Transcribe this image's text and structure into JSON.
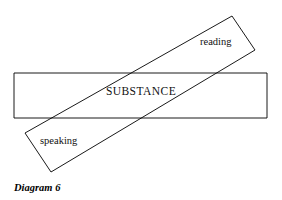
{
  "figure": {
    "caption": "Diagram 6",
    "background_color": "#ffffff",
    "stroke_color": "#000000",
    "text_color": "#000000",
    "width": 282,
    "height": 200
  },
  "shapes": {
    "horizontal_band": {
      "name": "SUBSTANCE",
      "label": "SUBSTANCE",
      "x": 14,
      "y": 73,
      "width": 253,
      "height": 45,
      "rotation_deg": 0
    },
    "diagonal_band": {
      "name": "skill-band",
      "labels": [
        "reading",
        "speaking"
      ],
      "corner_top": [
        232,
        16
      ],
      "corner_right": [
        255,
        50
      ],
      "corner_bottom": [
        51,
        172
      ],
      "corner_left": [
        25,
        133
      ],
      "rotation_deg": -31
    }
  },
  "labels": {
    "substance": "SUBSTANCE",
    "reading": "reading",
    "speaking": "speaking"
  }
}
